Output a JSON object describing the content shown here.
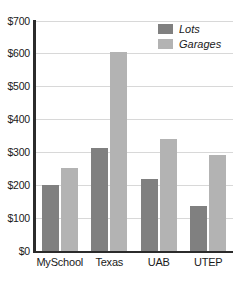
{
  "chart_data": {
    "type": "bar",
    "title": "",
    "subtitle": "",
    "xlabel": "",
    "ylabel": "",
    "categories": [
      "MySchool",
      "Texas",
      "UAB",
      "UTEP"
    ],
    "series": [
      {
        "name": "Lots",
        "color": "#808080",
        "values": [
          200,
          312,
          218,
          137
        ]
      },
      {
        "name": "Garages",
        "color": "#b3b3b3",
        "values": [
          250,
          603,
          338,
          292
        ]
      }
    ],
    "ylim": [
      0,
      700
    ],
    "ytick_values": [
      0,
      100,
      200,
      300,
      400,
      500,
      600,
      700
    ],
    "ytick_labels": [
      "$0",
      "$100",
      "$200",
      "$300",
      "$400",
      "$500",
      "$600",
      "$700"
    ],
    "grid": true,
    "grid_axis": "y",
    "legend_position": "top-right",
    "legend_italic": true,
    "bar_mode": "grouped"
  }
}
